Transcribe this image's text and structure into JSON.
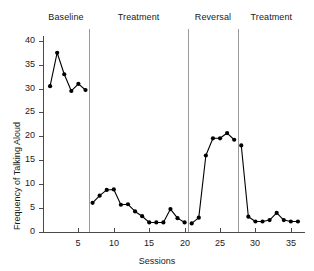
{
  "chart_data": {
    "type": "line",
    "title": "",
    "xlabel": "Sessions",
    "ylabel": "Frequency of Talking Aloud",
    "xlim": [
      0,
      37
    ],
    "ylim": [
      0,
      41
    ],
    "xticks": [
      5,
      10,
      15,
      20,
      25,
      30,
      35
    ],
    "yticks": [
      0,
      5,
      10,
      15,
      20,
      25,
      30,
      35,
      40
    ],
    "grid": false,
    "legend": "none",
    "marker": "filled-circle",
    "line_color": "#000000",
    "marker_color": "#000000",
    "divider_color": "#9a9a9a",
    "axis_color": "#4a4a4a",
    "phases": [
      {
        "label": "Baseline",
        "start": 1,
        "end": 6,
        "divider_after": 6.5
      },
      {
        "label": "Treatment",
        "start": 7,
        "end": 20,
        "divider_after": 20.5
      },
      {
        "label": "Reversal",
        "start": 21,
        "end": 27,
        "divider_after": 27.5
      },
      {
        "label": "Treatment",
        "start": 28,
        "end": 36,
        "divider_after": null
      }
    ],
    "series": [
      {
        "name": "Frequency of Talking Aloud",
        "segments": [
          {
            "phase": "Baseline",
            "x": [
              1,
              2,
              3,
              4,
              5,
              6
            ],
            "y": [
              30.5,
              37.5,
              33.0,
              29.5,
              31.0,
              29.7
            ]
          },
          {
            "phase": "Treatment",
            "x": [
              7,
              8,
              9,
              10,
              11,
              12,
              13,
              14,
              15,
              16,
              17,
              18,
              19,
              20
            ],
            "y": [
              6.1,
              7.6,
              8.8,
              8.9,
              5.7,
              5.8,
              4.3,
              3.3,
              2.0,
              2.0,
              2.0,
              4.8,
              2.9,
              2.0
            ]
          },
          {
            "phase": "Reversal",
            "x": [
              21,
              22,
              23,
              24,
              25,
              26,
              27
            ],
            "y": [
              1.8,
              3.0,
              16.0,
              19.6,
              19.6,
              20.7,
              19.3
            ]
          },
          {
            "phase": "Treatment",
            "x": [
              28,
              29,
              30,
              31,
              32,
              33,
              34,
              35,
              36
            ],
            "y": [
              18.1,
              3.2,
              2.2,
              2.2,
              2.5,
              4.0,
              2.5,
              2.2,
              2.2
            ]
          }
        ]
      }
    ]
  }
}
